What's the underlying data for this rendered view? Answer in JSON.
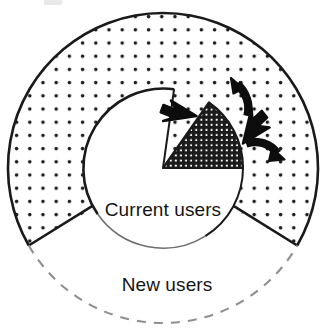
{
  "diagram": {
    "center": {
      "x": 163,
      "y": 168
    },
    "outer_radius": 155,
    "inner_radius": 80,
    "colors": {
      "stroke": "#1a1a1a",
      "fill_background": "#ffffff",
      "stipple_dot": "#1a1a1a",
      "dense_wedge": "#1a1a1a",
      "dashed_stroke": "#8a8a8a",
      "arrow": "#0d0d0d"
    },
    "rings": [
      {
        "name": "outer-ring",
        "label": "New users",
        "pattern": "sparse-dots",
        "start_angle_deg": -30,
        "end_angle_deg": 210,
        "solid_stroke": true
      },
      {
        "name": "inner-disc",
        "label": "Current users",
        "pattern": "solid-white",
        "solid_stroke": true
      }
    ],
    "wedges": [
      {
        "name": "dense-wedge",
        "pattern": "dense-dots",
        "start_angle_deg": 0,
        "end_angle_deg": 55,
        "description": "dark stippled segment of current users"
      },
      {
        "name": "gap-wedge",
        "pattern": "sparse-dots",
        "start_angle_deg": 55,
        "end_angle_deg": 82,
        "description": "open gap sector showing ring pattern"
      }
    ],
    "arrows": [
      {
        "name": "arrow-left",
        "direction": "up-left",
        "style": "straight"
      },
      {
        "name": "arrow-top",
        "direction": "up",
        "style": "curved"
      },
      {
        "name": "arrow-upright",
        "direction": "up-right",
        "style": "straight"
      },
      {
        "name": "arrow-downright",
        "direction": "down-right",
        "style": "curved"
      }
    ],
    "dashed_arc": {
      "name": "new-users-open-boundary",
      "start_angle_deg": 210,
      "end_angle_deg": 330,
      "dash_pattern": "9 8"
    }
  },
  "labels": {
    "current_users": "Current users",
    "new_users": "New users"
  }
}
